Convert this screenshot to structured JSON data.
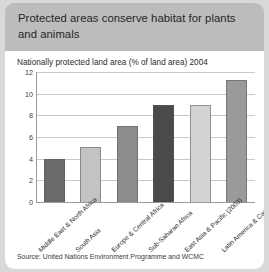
{
  "card": {
    "title": "Protected areas conserve habitat for plants and animals",
    "header_color": "#bcbcbc",
    "body_color": "#ffffff"
  },
  "chart_data": {
    "type": "bar",
    "title": "Nationally protected land area (% of land area) 2004",
    "xlabel": "",
    "ylabel": "",
    "ylim": [
      0,
      12
    ],
    "yticks": [
      0,
      2,
      4,
      6,
      8,
      10,
      12
    ],
    "grid": true,
    "legend": "none",
    "categories": [
      "Middle East & North Africa",
      "South Asia",
      "Europe & Central Africa",
      "Sub-Saharan Africa",
      "East Asia & Pacific (2003)",
      "Latin America & Caribbean"
    ],
    "values": [
      4.0,
      5.1,
      7.0,
      9.0,
      9.0,
      11.3
    ],
    "bar_colors": [
      "#6b6b6b",
      "#c3c3c3",
      "#8c8c8c",
      "#4a4a4a",
      "#d3d3d3",
      "#9a9a9a"
    ]
  },
  "source": "Source: United Nations Environment Programme and WCMC"
}
